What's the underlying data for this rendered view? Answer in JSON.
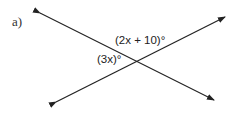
{
  "problem_label": "a)",
  "angles": {
    "top": "(2x + 10)°",
    "left": "(3x)°"
  },
  "lines": [
    {
      "from": [
        40,
        13
      ],
      "to": [
        214,
        100
      ]
    },
    {
      "from": [
        56,
        102
      ],
      "to": [
        225,
        17
      ]
    }
  ],
  "stroke_color": "#222222"
}
